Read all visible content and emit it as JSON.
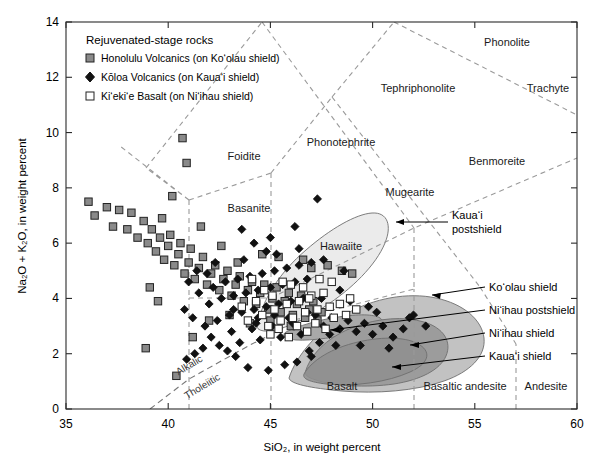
{
  "chart_data": {
    "type": "scatter",
    "title": "",
    "xlabel": "SiO2, in weight percent",
    "ylabel": "Na2O + K2O, in weight percent",
    "xlim": [
      35,
      60
    ],
    "ylim": [
      0,
      14
    ],
    "xticks": [
      35,
      40,
      45,
      50,
      55,
      60
    ],
    "yticks": [
      0,
      2,
      4,
      6,
      8,
      10,
      12,
      14
    ],
    "grid": false,
    "legend_position": "top-left",
    "series": [
      {
        "name": "Honolulu Volcanics (on Ko'olau shield)",
        "marker": "filled-square",
        "color": "#8a8a8a",
        "points": [
          [
            36.1,
            7.5
          ],
          [
            36.4,
            7.0
          ],
          [
            37.0,
            7.3
          ],
          [
            37.3,
            6.6
          ],
          [
            37.6,
            7.2
          ],
          [
            38.0,
            6.5
          ],
          [
            38.2,
            7.1
          ],
          [
            38.5,
            6.2
          ],
          [
            38.8,
            6.8
          ],
          [
            39.0,
            6.0
          ],
          [
            39.2,
            6.5
          ],
          [
            39.4,
            5.7
          ],
          [
            39.6,
            6.2
          ],
          [
            39.8,
            5.4
          ],
          [
            40.0,
            5.9
          ],
          [
            40.1,
            6.3
          ],
          [
            40.3,
            5.2
          ],
          [
            40.5,
            5.6
          ],
          [
            40.6,
            6.0
          ],
          [
            40.8,
            4.9
          ],
          [
            41.0,
            5.3
          ],
          [
            41.1,
            5.8
          ],
          [
            41.3,
            4.7
          ],
          [
            41.5,
            5.1
          ],
          [
            41.7,
            5.5
          ],
          [
            41.9,
            4.5
          ],
          [
            42.1,
            4.9
          ],
          [
            42.3,
            5.2
          ],
          [
            42.5,
            4.3
          ],
          [
            42.7,
            4.7
          ],
          [
            42.9,
            5.0
          ],
          [
            43.1,
            4.1
          ],
          [
            43.3,
            4.5
          ],
          [
            43.5,
            4.8
          ],
          [
            43.7,
            3.9
          ],
          [
            43.9,
            4.3
          ],
          [
            44.1,
            4.6
          ],
          [
            44.3,
            3.8
          ],
          [
            44.5,
            4.2
          ],
          [
            44.7,
            4.5
          ],
          [
            44.9,
            3.6
          ],
          [
            45.1,
            4.0
          ],
          [
            45.3,
            4.4
          ],
          [
            45.5,
            3.5
          ],
          [
            45.7,
            3.9
          ],
          [
            45.9,
            4.2
          ],
          [
            46.1,
            3.4
          ],
          [
            46.3,
            3.8
          ],
          [
            46.5,
            4.1
          ],
          [
            46.7,
            3.3
          ],
          [
            46.9,
            3.6
          ],
          [
            47.1,
            3.9
          ],
          [
            47.3,
            3.2
          ],
          [
            47.5,
            3.5
          ],
          [
            40.7,
            9.8
          ],
          [
            40.9,
            8.9
          ],
          [
            39.1,
            4.4
          ],
          [
            39.5,
            3.9
          ],
          [
            38.9,
            2.2
          ],
          [
            40.4,
            1.2
          ],
          [
            41.2,
            2.6
          ],
          [
            42.0,
            3.2
          ],
          [
            43.0,
            3.4
          ],
          [
            44.0,
            3.1
          ],
          [
            45.0,
            3.2
          ],
          [
            46.0,
            3.0
          ],
          [
            47.0,
            5.1
          ],
          [
            47.8,
            5.2
          ],
          [
            48.5,
            5.0
          ],
          [
            49.0,
            4.9
          ],
          [
            44.6,
            5.6
          ],
          [
            45.4,
            5.5
          ],
          [
            46.6,
            5.4
          ],
          [
            43.4,
            5.3
          ],
          [
            42.6,
            5.9
          ],
          [
            41.6,
            6.6
          ],
          [
            40.2,
            7.7
          ],
          [
            39.7,
            6.9
          ]
        ]
      },
      {
        "name": "Kōloa Volcanics (on Kaua'i shield)",
        "marker": "filled-diamond",
        "color": "#111111",
        "points": [
          [
            40.8,
            3.6
          ],
          [
            41.2,
            3.3
          ],
          [
            41.5,
            4.2
          ],
          [
            41.8,
            3.0
          ],
          [
            42.0,
            3.8
          ],
          [
            42.2,
            4.4
          ],
          [
            42.4,
            3.2
          ],
          [
            42.6,
            4.0
          ],
          [
            42.8,
            4.6
          ],
          [
            43.0,
            3.4
          ],
          [
            43.2,
            4.1
          ],
          [
            43.4,
            4.7
          ],
          [
            43.6,
            3.5
          ],
          [
            43.8,
            4.2
          ],
          [
            44.0,
            4.8
          ],
          [
            44.2,
            3.6
          ],
          [
            44.4,
            4.3
          ],
          [
            44.6,
            4.9
          ],
          [
            44.8,
            3.7
          ],
          [
            45.0,
            4.4
          ],
          [
            45.2,
            5.0
          ],
          [
            45.4,
            3.8
          ],
          [
            45.6,
            4.5
          ],
          [
            45.8,
            5.1
          ],
          [
            46.0,
            3.9
          ],
          [
            46.2,
            4.6
          ],
          [
            46.4,
            5.2
          ],
          [
            46.6,
            4.0
          ],
          [
            46.8,
            4.7
          ],
          [
            47.0,
            5.3
          ],
          [
            42.1,
            2.6
          ],
          [
            42.5,
            2.3
          ],
          [
            43.1,
            2.8
          ],
          [
            43.5,
            2.4
          ],
          [
            44.1,
            2.9
          ],
          [
            44.5,
            2.5
          ],
          [
            45.1,
            3.0
          ],
          [
            45.5,
            2.6
          ],
          [
            46.1,
            3.1
          ],
          [
            46.5,
            2.7
          ],
          [
            41.7,
            2.2
          ],
          [
            41.3,
            2.0
          ],
          [
            40.9,
            1.8
          ],
          [
            44.9,
            1.4
          ],
          [
            45.7,
            1.6
          ],
          [
            46.9,
            2.1
          ],
          [
            47.4,
            2.4
          ],
          [
            47.9,
            2.7
          ],
          [
            43.9,
            1.5
          ],
          [
            43.3,
            1.9
          ],
          [
            42.9,
            2.1
          ],
          [
            47.2,
            3.4
          ],
          [
            47.6,
            3.0
          ],
          [
            48.0,
            3.3
          ],
          [
            48.4,
            2.9
          ],
          [
            48.8,
            3.2
          ],
          [
            49.2,
            2.8
          ],
          [
            49.6,
            3.1
          ],
          [
            50.0,
            2.7
          ],
          [
            50.5,
            3.0
          ],
          [
            51.0,
            2.6
          ],
          [
            51.5,
            2.9
          ],
          [
            52.0,
            3.4
          ],
          [
            52.6,
            3.0
          ],
          [
            47.3,
            7.6
          ],
          [
            46.2,
            6.6
          ],
          [
            45.0,
            6.2
          ],
          [
            44.2,
            6.0
          ],
          [
            43.6,
            6.5
          ],
          [
            44.8,
            5.7
          ],
          [
            46.4,
            5.8
          ],
          [
            47.6,
            5.4
          ],
          [
            48.6,
            5.0
          ],
          [
            49.4,
            2.3
          ],
          [
            50.8,
            2.2
          ],
          [
            48.2,
            2.3
          ],
          [
            47.0,
            1.9
          ],
          [
            46.3,
            1.7
          ],
          [
            41.0,
            4.6
          ],
          [
            41.4,
            5.0
          ],
          [
            41.9,
            4.9
          ],
          [
            42.3,
            5.3
          ],
          [
            43.7,
            5.4
          ],
          [
            45.3,
            5.6
          ],
          [
            44.3,
            3.1
          ],
          [
            45.9,
            3.3
          ],
          [
            47.5,
            4.0
          ],
          [
            48.9,
            3.9
          ],
          [
            50.2,
            3.5
          ],
          [
            51.8,
            3.3
          ],
          [
            49.8,
            3.7
          ],
          [
            48.4,
            4.3
          ],
          [
            46.8,
            3.5
          ],
          [
            45.2,
            3.4
          ],
          [
            44.4,
            3.3
          ],
          [
            43.2,
            3.6
          ]
        ]
      },
      {
        "name": "Ki'eki'e Basalt (on Ni'ihau shield)",
        "marker": "open-square",
        "color": "#ffffff",
        "points": [
          [
            44.6,
            3.4
          ],
          [
            44.9,
            3.0
          ],
          [
            45.2,
            3.6
          ],
          [
            45.5,
            3.2
          ],
          [
            45.8,
            3.8
          ],
          [
            46.1,
            3.3
          ],
          [
            46.4,
            3.9
          ],
          [
            46.7,
            3.5
          ],
          [
            47.0,
            4.1
          ],
          [
            47.3,
            3.6
          ],
          [
            47.6,
            4.2
          ],
          [
            47.9,
            3.7
          ],
          [
            45.0,
            2.7
          ],
          [
            45.4,
            2.9
          ],
          [
            45.9,
            2.6
          ],
          [
            46.3,
            3.0
          ],
          [
            46.8,
            2.8
          ],
          [
            47.2,
            3.1
          ],
          [
            47.7,
            2.9
          ],
          [
            48.1,
            3.3
          ],
          [
            48.4,
            3.8
          ],
          [
            48.7,
            3.4
          ],
          [
            44.3,
            3.9
          ],
          [
            44.7,
            4.3
          ],
          [
            46.0,
            4.5
          ],
          [
            46.6,
            4.4
          ],
          [
            45.6,
            4.6
          ],
          [
            48.0,
            4.6
          ],
          [
            43.9,
            3.2
          ],
          [
            43.6,
            3.7
          ],
          [
            45.1,
            4.1
          ],
          [
            46.9,
            4.0
          ],
          [
            47.4,
            4.7
          ],
          [
            44.1,
            4.7
          ],
          [
            48.9,
            4.0
          ],
          [
            49.2,
            3.6
          ]
        ]
      }
    ],
    "tas_fields": [
      "Foidite",
      "Basanite",
      "Phonotephrite",
      "Tephriphonolite",
      "Phonolite",
      "Trachyte",
      "Benmoreite",
      "Mugearite",
      "Hawaiite",
      "Basalt",
      "Basaltic andesite",
      "Andesite"
    ],
    "series_annotations": [
      "Kaua'i postshield",
      "Ko'olau shield",
      "Ni'ihau postshield",
      "Ni'ihau shield",
      "Kaua'i shield"
    ],
    "divider_labels": [
      "Alkalic",
      "Tholeiitic"
    ]
  },
  "axes": {
    "x_title": "SiO₂, in weight percent",
    "y_title": "Na₂O + K₂O, in weight percent",
    "x_ticks": [
      "35",
      "40",
      "45",
      "50",
      "55",
      "60"
    ],
    "y_ticks": [
      "0",
      "2",
      "4",
      "6",
      "8",
      "10",
      "12",
      "14"
    ]
  },
  "legend": {
    "title": "Rejuvenated-stage rocks",
    "items": [
      {
        "label": "Honolulu Volcanics (on Ko‘olau shield)",
        "marker": "filled-square"
      },
      {
        "label": "Kōloa Volcanics (on Kaua‘i shield)",
        "marker": "filled-diamond"
      },
      {
        "label": "Ki‘eki‘e Basalt (on Ni‘ihau shield)",
        "marker": "open-square"
      }
    ]
  },
  "fields": {
    "foidite": "Foidite",
    "basanite": "Basanite",
    "phonotephrite": "Phonotephrite",
    "tephriphonolite": "Tephriphonolite",
    "phonolite": "Phonolite",
    "trachyte": "Trachyte",
    "benmoreite": "Benmoreite",
    "mugearite": "Mugearite",
    "hawaiite": "Hawaiite",
    "basalt": "Basalt",
    "basaltic_andesite": "Basaltic andesite",
    "andesite": "Andesite"
  },
  "dividers": {
    "alkalic": "Alkalic",
    "tholeiitic": "Tholeiitic"
  },
  "annotations": {
    "kauai_postshield_l1": "Kaua‘i",
    "kauai_postshield_l2": "postshield",
    "koolau_shield": "Ko‘olau shield",
    "niihau_postshield": "Ni‘ihau postshield",
    "niihau_shield": "Ni‘ihau shield",
    "kauai_shield": "Kaua‘i shield"
  },
  "colors": {
    "frame": "#2b2b2b",
    "field_line": "#9a9a9a",
    "honolulu_marker": "#8a8a8a",
    "koloa_marker": "#111111",
    "kieikie_marker": "#ffffff",
    "kauai_postshield_fill": "#ebebeb",
    "koolau_shield_fill": "#c2c2c2",
    "niihau_postshield_fill": "#a9a9a9",
    "niihau_shield_fill": "#9c9c9c",
    "kauai_shield_fill": "#8f8f8f"
  }
}
